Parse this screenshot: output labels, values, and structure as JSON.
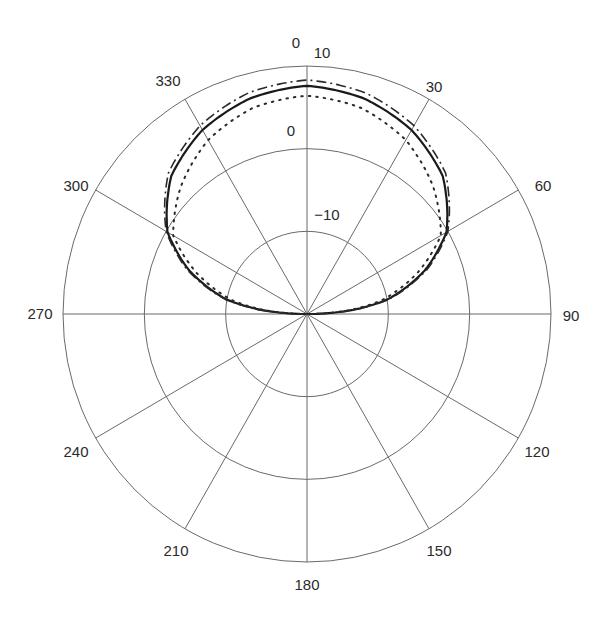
{
  "chart_data": {
    "type": "polar-line",
    "title": "",
    "angle_unit": "degrees",
    "angle_zero": "top",
    "angle_direction": "clockwise",
    "angle_ticks": [
      0,
      30,
      60,
      90,
      120,
      150,
      180,
      210,
      240,
      270,
      300,
      330
    ],
    "angle_tick_labels": [
      "0",
      "30",
      "60",
      "90",
      "120",
      "150",
      "180",
      "210",
      "240",
      "270",
      "300",
      "330"
    ],
    "radial_axis": {
      "unit": "dB",
      "range": [
        -20,
        10
      ],
      "rings": [
        -10,
        0,
        10
      ],
      "ring_labels": [
        "-10",
        "0",
        "10"
      ]
    },
    "grid": true,
    "legend": null,
    "series": [
      {
        "name": "solid",
        "style": "solid",
        "angles": [
          0,
          15,
          30,
          45,
          60,
          70,
          80,
          85,
          90
        ],
        "values": [
          7.6,
          7.0,
          5.7,
          3.6,
          -0.2,
          -4.6,
          -10.0,
          -14.3,
          -20
        ],
        "symmetric": true
      },
      {
        "name": "dash-dot",
        "style": "dashdot",
        "angles": [
          0,
          15,
          30,
          45,
          60,
          70,
          80,
          85,
          90
        ],
        "values": [
          8.3,
          7.7,
          6.3,
          4.1,
          0.0,
          -4.3,
          -9.8,
          -14.0,
          -20
        ],
        "symmetric": true
      },
      {
        "name": "dotted",
        "style": "dotted",
        "angles": [
          0,
          15,
          30,
          45,
          60,
          70,
          80,
          85,
          90
        ],
        "values": [
          6.4,
          5.8,
          4.3,
          1.9,
          -1.0,
          -5.6,
          -10.8,
          -14.8,
          -20
        ],
        "symmetric": true
      }
    ]
  },
  "labels": {
    "angles": [
      {
        "text": "0",
        "x": 296,
        "y": 48
      },
      {
        "text": "30",
        "x": 434,
        "y": 92
      },
      {
        "text": "60",
        "x": 543,
        "y": 191
      },
      {
        "text": "90",
        "x": 571,
        "y": 321
      },
      {
        "text": "120",
        "x": 537,
        "y": 457
      },
      {
        "text": "150",
        "x": 439,
        "y": 556
      },
      {
        "text": "180",
        "x": 307,
        "y": 590
      },
      {
        "text": "210",
        "x": 176,
        "y": 556
      },
      {
        "text": "240",
        "x": 76,
        "y": 457
      },
      {
        "text": "270",
        "x": 40,
        "y": 319
      },
      {
        "text": "300",
        "x": 76,
        "y": 191
      },
      {
        "text": "330",
        "x": 168,
        "y": 86
      }
    ],
    "rings": [
      {
        "text": "10",
        "x": 322,
        "y": 58
      },
      {
        "text": "0",
        "x": 291,
        "y": 136
      },
      {
        "text": "−10",
        "x": 327,
        "y": 220
      }
    ]
  }
}
